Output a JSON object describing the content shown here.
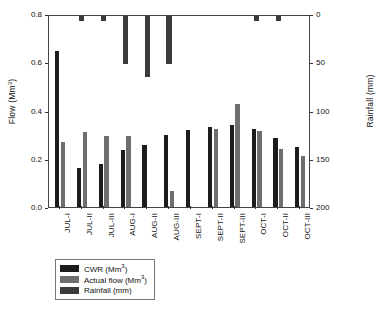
{
  "chart_data": {
    "type": "bar",
    "title": "",
    "xlabel": "",
    "ylabel": "Flow (Mm3)",
    "ylabel_base": "Flow (Mm",
    "ylabel_sup": "3",
    "ylabel_tail": ")",
    "y2label_base": "Rainfall (mm)",
    "ylim": [
      0.0,
      0.8
    ],
    "y2lim": [
      0,
      200
    ],
    "y2_inverted": true,
    "grid": false,
    "legend_position": "below-plot-left",
    "categories": [
      "JUL-I",
      "JUL-II",
      "JUL-III",
      "AUG-I",
      "AUG-II",
      "AUG-III",
      "SEPT-I",
      "SEPT-II",
      "SEPT-III",
      "OCT-I",
      "OCT-II",
      "OCT-III"
    ],
    "yticks": [
      "0.0",
      "0.2",
      "0.4",
      "0.6",
      "0.8"
    ],
    "ytick_values": [
      0.0,
      0.2,
      0.4,
      0.6,
      0.8
    ],
    "y2ticks": [
      "0",
      "50",
      "100",
      "150",
      "200"
    ],
    "y2tick_values": [
      0,
      50,
      100,
      150,
      200
    ],
    "series": [
      {
        "name": "CWR (Mm3)",
        "label_base": "CWR (Mm",
        "label_sup": "3",
        "label_tail": ")",
        "axis": "left",
        "color": "#1c1c1c",
        "values": [
          0.645,
          0.16,
          0.18,
          0.235,
          0.255,
          0.3,
          0.32,
          0.33,
          0.34,
          0.325,
          0.285,
          0.25
        ]
      },
      {
        "name": "Actual flow (Mm3)",
        "label_base": "Actual flow (Mm",
        "label_sup": "3",
        "label_tail": ")",
        "axis": "left",
        "color": "#6e6e6e",
        "values": [
          0.27,
          0.31,
          0.295,
          0.295,
          0.0,
          0.065,
          0.0,
          0.325,
          0.425,
          0.315,
          0.24,
          0.21
        ]
      },
      {
        "name": "Rainfall (mm)",
        "label_base": "Rainfall (mm)",
        "label_sup": "",
        "label_tail": "",
        "axis": "right",
        "color": "#3a3a3a",
        "values": [
          0,
          5,
          5,
          50,
          63,
          50,
          0,
          0,
          0,
          5,
          5,
          0
        ]
      }
    ]
  }
}
